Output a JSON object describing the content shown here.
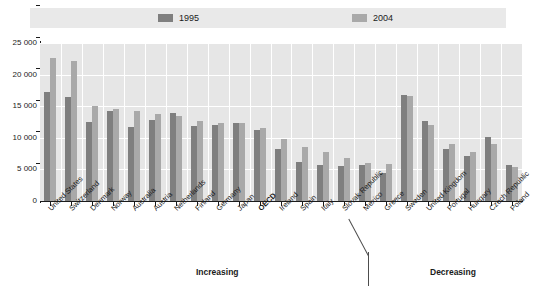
{
  "legend": {
    "items": [
      {
        "label": "1995",
        "color": "#7f7f7f"
      },
      {
        "label": "2004",
        "color": "#a9a9a9"
      }
    ]
  },
  "annotations": {
    "increasing": "Increasing",
    "decreasing": "Decreasing"
  },
  "chart_data": {
    "type": "bar",
    "title": "",
    "subtitle": "",
    "xlabel": "",
    "ylabel": "",
    "ylim": [
      0,
      25000
    ],
    "yticks": [
      "0",
      "5 000",
      "10 000",
      "15 000",
      "20 000",
      "25 000"
    ],
    "ytick_values": [
      0,
      5000,
      10000,
      15000,
      20000,
      25000
    ],
    "grid": true,
    "legend_position": "top",
    "categories": [
      "United States",
      "Switzerland",
      "Denmark",
      "Norway",
      "Australia",
      "Austria",
      "Netherlands",
      "Finland",
      "Germany",
      "Japan",
      "OECD",
      "Ireland",
      "Spain",
      "Italy",
      "Slovak Republic",
      "Mexico",
      "Greece",
      "Sweden",
      "United Kingdom",
      "Portugal",
      "Hungary",
      "Czech Republic",
      "Poland"
    ],
    "highlight_category": "OECD",
    "series": [
      {
        "name": "1995",
        "color": "#7f7f7f",
        "values": [
          17200,
          16500,
          12500,
          14200,
          11700,
          12800,
          14000,
          11800,
          12000,
          12300,
          11200,
          8300,
          6100,
          5700,
          5600,
          5700,
          4400,
          16800,
          12700,
          8300,
          7200,
          10200,
          5700
        ]
      },
      {
        "name": "2004",
        "color": "#a9a9a9",
        "values": [
          22700,
          22200,
          15000,
          14500,
          14200,
          13700,
          13400,
          12600,
          12300,
          12400,
          11600,
          9800,
          8600,
          7700,
          6800,
          6000,
          5900,
          16600,
          12000,
          9000,
          7700,
          9000,
          5400
        ]
      }
    ]
  }
}
